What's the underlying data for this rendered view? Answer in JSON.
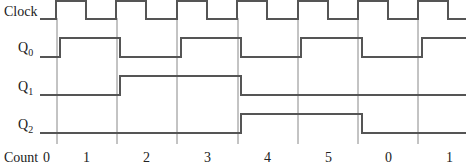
{
  "diagram": {
    "type": "timing-diagram",
    "signals": [
      {
        "name": "Clock",
        "sub": "",
        "label_y": 16
      },
      {
        "name": "Q",
        "sub": "0",
        "label_y": 52
      },
      {
        "name": "Q",
        "sub": "1",
        "label_y": 91
      },
      {
        "name": "Q",
        "sub": "2",
        "label_y": 129
      }
    ],
    "count_label": "Count",
    "counts": [
      "0",
      "1",
      "2",
      "3",
      "4",
      "5",
      "0",
      "1"
    ],
    "colors": {
      "wave": "#555555",
      "grid": "#888888",
      "text": "#222222"
    }
  }
}
